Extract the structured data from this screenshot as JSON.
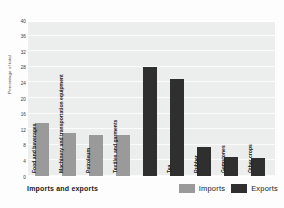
{
  "chart_data": {
    "type": "bar",
    "title": "",
    "xlabel": "Imports and exports",
    "ylabel": "Percentage of total",
    "ylim": [
      0,
      40
    ],
    "grid": true,
    "legend_position": "bottom-right",
    "categories": [
      "Food and beverages",
      "Machinery and transportation equipment",
      "Petroleum",
      "Textiles and garments",
      "Tea",
      "Rubber",
      "Gemstones",
      "Other crops"
    ],
    "yticks": [
      0,
      4,
      8,
      12,
      16,
      20,
      24,
      28,
      32,
      36,
      40
    ],
    "series": [
      {
        "name": "Imports",
        "color": "#9a9a9a",
        "values": [
          13.5,
          11,
          10.5,
          10.5,
          null,
          null,
          null,
          null
        ]
      },
      {
        "name": "Exports",
        "color": "#2f2f2f",
        "values": [
          null,
          null,
          null,
          28,
          25,
          7.5,
          5,
          4.5
        ]
      }
    ],
    "bars": [
      {
        "label": "Food and beverages",
        "value": 13.5,
        "series": "Imports",
        "color": "#9a9a9a"
      },
      {
        "label": "Machinery and transportation equipment",
        "value": 11,
        "series": "Imports",
        "color": "#9a9a9a"
      },
      {
        "label": "Petroleum",
        "value": 10.5,
        "series": "Imports",
        "color": "#9a9a9a"
      },
      {
        "label": "Textiles and garments",
        "value": 10.5,
        "series": "Imports",
        "color": "#9a9a9a"
      },
      {
        "label": "Textiles and garments",
        "value": 28,
        "series": "Exports",
        "color": "#2f2f2f"
      },
      {
        "label": "Tea",
        "value": 25,
        "series": "Exports",
        "color": "#2f2f2f"
      },
      {
        "label": "Rubber",
        "value": 7.5,
        "series": "Exports",
        "color": "#2f2f2f"
      },
      {
        "label": "Gemstones",
        "value": 5,
        "series": "Exports",
        "color": "#2f2f2f"
      },
      {
        "label": "Other crops",
        "value": 4.5,
        "series": "Exports",
        "color": "#2f2f2f"
      }
    ]
  },
  "axis": {
    "y_title": "Percentage of total",
    "y_ticks": [
      "40",
      "36",
      "32",
      "28",
      "24",
      "20",
      "16",
      "12",
      "8",
      "4",
      "0"
    ],
    "x_title": "Imports and exports"
  },
  "bar_labels": [
    "Food and beverages",
    "Machinery and transportation equipment",
    "Petroleum",
    "Textiles and garments",
    "Tea",
    "Rubber",
    "Gemstones",
    "Other crops"
  ],
  "legend": {
    "entries": [
      {
        "label": "Imports",
        "color": "#9a9a9a"
      },
      {
        "label": "Exports",
        "color": "#2f2f2f"
      }
    ]
  },
  "colors": {
    "imports": "#9a9a9a",
    "exports": "#2f2f2f",
    "plot_background": "#eceded",
    "gridline": "#fbfbfb",
    "page_background": "#fdfdfd"
  }
}
